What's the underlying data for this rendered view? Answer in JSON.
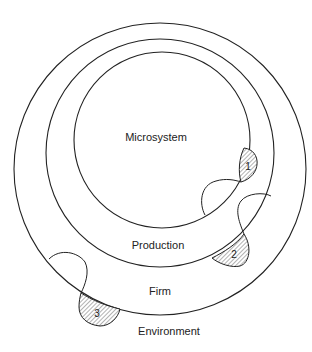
{
  "diagram": {
    "type": "nested-systems",
    "labels": {
      "microsystem": "Microsystem",
      "production": "Production",
      "firm": "Firm",
      "environment": "Environment"
    },
    "interfaces": [
      {
        "number": "1",
        "between": [
          "Microsystem",
          "Production"
        ]
      },
      {
        "number": "2",
        "between": [
          "Production",
          "Firm"
        ]
      },
      {
        "number": "3",
        "between": [
          "Firm",
          "Environment"
        ]
      }
    ],
    "colors": {
      "stroke": "#222222",
      "hatch": "#555555",
      "background": "#ffffff"
    }
  }
}
